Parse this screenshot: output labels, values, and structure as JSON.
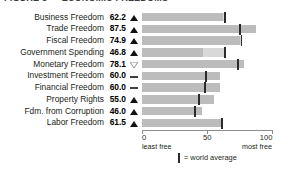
{
  "title": "FIGURE 3 — ECONOMIC FREEDOMS",
  "chart_data": {
    "type": "bar",
    "title": "FIGURE 3 — ECONOMIC FREEDOMS",
    "orientation": "horizontal",
    "xlabel": "",
    "ylabel": "",
    "xlim": [
      0,
      100
    ],
    "grid": false,
    "legend_position": "bottom",
    "axis": {
      "ticks": [
        "0",
        "50",
        "100"
      ],
      "tick_values": [
        0,
        50,
        100
      ],
      "left_caption": "least free",
      "right_caption": "most free"
    },
    "legend": {
      "marker": "world-average-tick",
      "label": "= world average"
    },
    "categories": [
      "Business Freedom",
      "Trade Freedom",
      "Fiscal Freedom",
      "Government Spending",
      "Monetary Freedom",
      "Investment Freedom",
      "Financial Freedom",
      "Property Rights",
      "Fdm. from Corruption",
      "Labor Freedom"
    ],
    "values": [
      62.2,
      87.5,
      74.9,
      46.8,
      78.1,
      60.0,
      60.0,
      55.0,
      46.0,
      61.5
    ],
    "value_labels": [
      "62.2",
      "87.5",
      "74.9",
      "46.8",
      "78.1",
      "60.0",
      "60.0",
      "55.0",
      "46.0",
      "61.5"
    ],
    "trend": [
      "up",
      "up",
      "up",
      "up",
      "down",
      "flat",
      "flat",
      "up",
      "up",
      "up"
    ],
    "world_average": [
      63.4,
      74.8,
      76.3,
      63.5,
      73.4,
      49.0,
      48.5,
      43.5,
      40.5,
      61.5
    ],
    "series": [
      {
        "name": "country score",
        "values": [
          62.2,
          87.5,
          74.9,
          46.8,
          78.1,
          60.0,
          60.0,
          55.0,
          46.0,
          61.5
        ]
      },
      {
        "name": "world average",
        "values": [
          63.4,
          74.8,
          76.3,
          63.5,
          73.4,
          49.0,
          48.5,
          43.5,
          40.5,
          61.5
        ]
      }
    ],
    "colors": {
      "bar": "#bcbcbc",
      "bar_beyond_average": "#d8d8d8",
      "average_tick": "#2b2b2b",
      "axis": "#8d8d8d",
      "text": "#231f20"
    }
  },
  "rows": [
    {
      "label": "Business Freedom",
      "value": "62.2",
      "trend": "up"
    },
    {
      "label": "Trade Freedom",
      "value": "87.5",
      "trend": "up"
    },
    {
      "label": "Fiscal Freedom",
      "value": "74.9",
      "trend": "up"
    },
    {
      "label": "Government Spending",
      "value": "46.8",
      "trend": "up"
    },
    {
      "label": "Monetary Freedom",
      "value": "78.1",
      "trend": "down"
    },
    {
      "label": "Investment Freedom",
      "value": "60.0",
      "trend": "flat"
    },
    {
      "label": "Financial Freedom",
      "value": "60.0",
      "trend": "flat"
    },
    {
      "label": "Property Rights",
      "value": "55.0",
      "trend": "up"
    },
    {
      "label": "Fdm. from Corruption",
      "value": "46.0",
      "trend": "up"
    },
    {
      "label": "Labor Freedom",
      "value": "61.5",
      "trend": "up"
    }
  ]
}
